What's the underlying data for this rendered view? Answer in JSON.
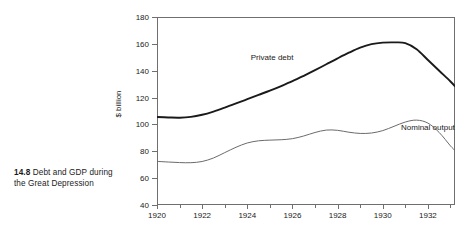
{
  "caption": {
    "number": "14.8",
    "text": "Debt and GDP during the Great Depression"
  },
  "chart_data": {
    "type": "line",
    "title": "",
    "xlabel": "",
    "ylabel": "$ billion",
    "xlim": [
      1920,
      1933.2
    ],
    "ylim": [
      40,
      180
    ],
    "grid": false,
    "legend_position": "inline-labels",
    "yticks": [
      40,
      60,
      80,
      100,
      120,
      140,
      160,
      180
    ],
    "xticks_major": [
      1920,
      1922,
      1924,
      1926,
      1928,
      1930,
      1932
    ],
    "xticks_minor": [
      1921,
      1923,
      1925,
      1927,
      1929,
      1931,
      1933
    ],
    "x": [
      1920,
      1920.5,
      1921,
      1921.5,
      1922,
      1922.5,
      1923,
      1923.5,
      1924,
      1924.5,
      1925,
      1925.5,
      1926,
      1926.5,
      1927,
      1927.5,
      1928,
      1928.5,
      1929,
      1929.5,
      1930,
      1930.5,
      1931,
      1931.5,
      1932,
      1932.5,
      1933,
      1933.2
    ],
    "series": [
      {
        "name": "Private debt",
        "color": "#1a1a1a",
        "width": 1.9,
        "label_x": 1925.1,
        "label_y": 150,
        "values": [
          105.5,
          105.2,
          105.0,
          105.6,
          107.2,
          109.6,
          112.5,
          115.6,
          118.8,
          122.0,
          125.2,
          128.6,
          132.2,
          136.2,
          140.4,
          144.8,
          149.2,
          153.4,
          157.2,
          159.8,
          160.9,
          161.1,
          160.6,
          156.0,
          148.0,
          140.0,
          132.0,
          128.5
        ]
      },
      {
        "name": "Nominal output",
        "color": "#6b6b6b",
        "width": 1.0,
        "label_x": 1932.0,
        "label_y": 98,
        "values": [
          72.5,
          72.0,
          71.6,
          71.5,
          72.4,
          75.0,
          79.0,
          83.0,
          86.2,
          87.8,
          88.3,
          88.6,
          89.4,
          91.4,
          94.0,
          95.8,
          95.6,
          94.2,
          93.3,
          93.6,
          95.4,
          98.6,
          101.8,
          103.2,
          101.0,
          94.0,
          84.0,
          80.5
        ]
      }
    ],
    "tail": {
      "note": "nominal output continues falling to trough near 55 then flattens",
      "x": [
        1933.2,
        1933.6,
        1934.0,
        1934.4,
        1934.8,
        1935.0
      ],
      "values": [
        80.5,
        72.0,
        64.0,
        58.0,
        55.2,
        55.0
      ]
    }
  },
  "axis_colors": {
    "frame": "#6f6f6f",
    "text": "#222222"
  }
}
